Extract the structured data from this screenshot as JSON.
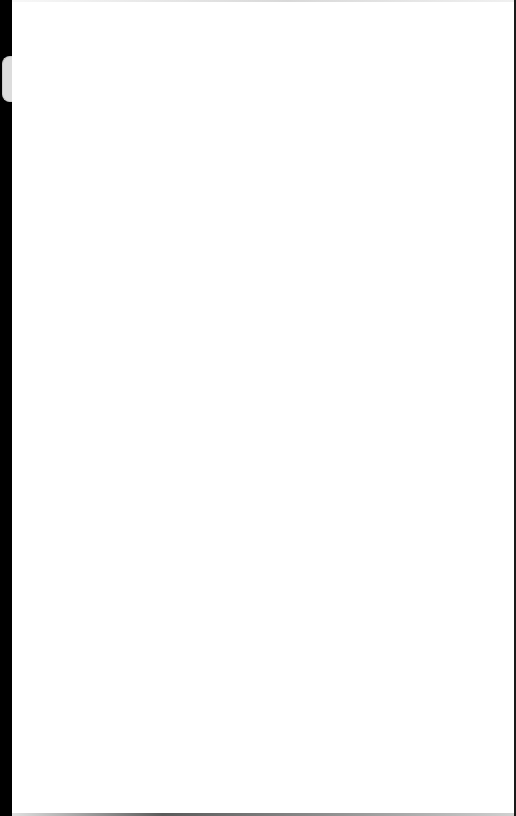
{
  "screen": {
    "state": "blank",
    "background_color": "#ffffff",
    "bezel_color": "#000000",
    "side_tab_color": "#dcdcdc"
  },
  "content": {
    "text": ""
  }
}
